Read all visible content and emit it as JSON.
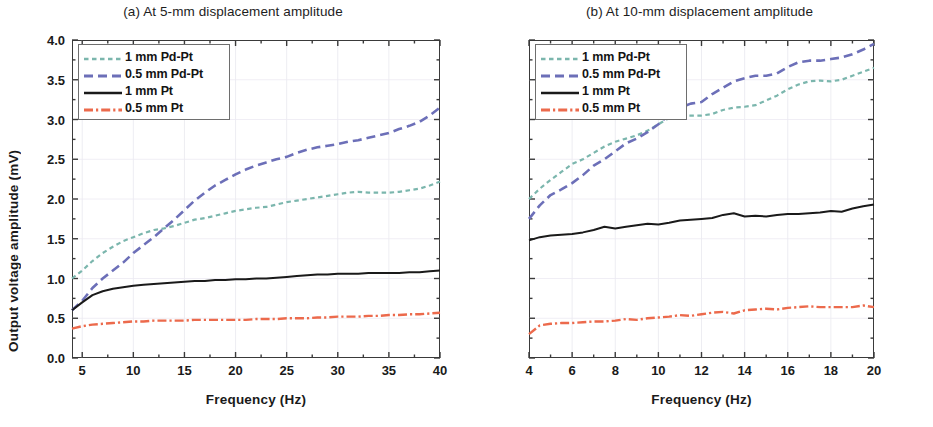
{
  "figure": {
    "axis_label_x": "Frequency (Hz)",
    "axis_label_y": "Output voltage amplitude (mV)"
  },
  "series_colors": {
    "pdpt_1mm": "#7bb6ad",
    "pdpt_05mm": "#6c6fb8",
    "pt_1mm": "#1a1a1a",
    "pt_05mm": "#ec6a4c"
  },
  "legend": {
    "entries": [
      {
        "label": "1 mm Pd-Pt",
        "color": "#7bb6ad",
        "style": "dotted-dash"
      },
      {
        "label": "0.5 mm Pd-Pt",
        "color": "#6c6fb8",
        "style": "dashed"
      },
      {
        "label": "1 mm Pt",
        "color": "#1a1a1a",
        "style": "solid"
      },
      {
        "label": "0.5 mm Pt",
        "color": "#ec6a4c",
        "style": "dash-dot"
      }
    ]
  },
  "chart_data": [
    {
      "type": "line",
      "panel": "a",
      "title": "(a) At 5-mm displacement amplitude",
      "xlabel": "Frequency (Hz)",
      "ylabel": "Output voltage amplitude (mV)",
      "xlim": [
        4,
        40
      ],
      "ylim": [
        0.0,
        4.0
      ],
      "xticks": [
        5,
        10,
        15,
        20,
        25,
        30,
        35,
        40
      ],
      "yticks": [
        0.0,
        0.5,
        1.0,
        1.5,
        2.0,
        2.5,
        3.0,
        3.5,
        4.0
      ],
      "xtick_labels": [
        "5",
        "10",
        "15",
        "20",
        "25",
        "30",
        "35",
        "40"
      ],
      "ytick_labels": [
        "0.0",
        "0.5",
        "1.0",
        "1.5",
        "2.0",
        "2.5",
        "3.0",
        "3.5",
        "4.0"
      ],
      "minor_ticks": true,
      "grid": "faint",
      "legend_position": "top-left",
      "x": [
        4,
        5,
        6,
        7,
        8,
        9,
        10,
        11,
        12,
        13,
        14,
        15,
        16,
        17,
        18,
        19,
        20,
        21,
        22,
        23,
        24,
        25,
        26,
        27,
        28,
        29,
        30,
        31,
        32,
        33,
        34,
        35,
        36,
        37,
        38,
        39,
        40
      ],
      "series": [
        {
          "name": "1 mm Pd-Pt",
          "color": "#7bb6ad",
          "values": [
            1.0,
            1.1,
            1.22,
            1.32,
            1.4,
            1.47,
            1.52,
            1.57,
            1.61,
            1.63,
            1.66,
            1.7,
            1.74,
            1.76,
            1.79,
            1.82,
            1.85,
            1.87,
            1.89,
            1.9,
            1.93,
            1.96,
            1.98,
            2.0,
            2.02,
            2.04,
            2.06,
            2.08,
            2.09,
            2.08,
            2.08,
            2.08,
            2.09,
            2.11,
            2.13,
            2.17,
            2.22
          ]
        },
        {
          "name": "0.5 mm Pd-Pt",
          "color": "#6c6fb8",
          "values": [
            0.6,
            0.72,
            0.88,
            1.0,
            1.1,
            1.2,
            1.32,
            1.42,
            1.52,
            1.63,
            1.74,
            1.86,
            1.98,
            2.08,
            2.17,
            2.24,
            2.31,
            2.37,
            2.42,
            2.46,
            2.5,
            2.53,
            2.58,
            2.62,
            2.65,
            2.67,
            2.69,
            2.72,
            2.74,
            2.77,
            2.8,
            2.83,
            2.88,
            2.92,
            2.97,
            3.05,
            3.15
          ]
        },
        {
          "name": "1 mm Pt",
          "color": "#1a1a1a",
          "values": [
            0.6,
            0.7,
            0.79,
            0.84,
            0.87,
            0.89,
            0.91,
            0.92,
            0.93,
            0.94,
            0.95,
            0.96,
            0.97,
            0.97,
            0.98,
            0.98,
            0.99,
            0.99,
            1.0,
            1.0,
            1.01,
            1.02,
            1.03,
            1.04,
            1.05,
            1.05,
            1.06,
            1.06,
            1.06,
            1.07,
            1.07,
            1.07,
            1.07,
            1.08,
            1.08,
            1.09,
            1.1
          ]
        },
        {
          "name": "0.5 mm Pt",
          "color": "#ec6a4c",
          "values": [
            0.37,
            0.4,
            0.42,
            0.43,
            0.44,
            0.45,
            0.46,
            0.46,
            0.47,
            0.47,
            0.47,
            0.47,
            0.48,
            0.48,
            0.48,
            0.48,
            0.48,
            0.48,
            0.49,
            0.49,
            0.49,
            0.5,
            0.5,
            0.5,
            0.51,
            0.51,
            0.52,
            0.52,
            0.52,
            0.53,
            0.53,
            0.54,
            0.54,
            0.55,
            0.55,
            0.56,
            0.57
          ]
        }
      ]
    },
    {
      "type": "line",
      "panel": "b",
      "title": "(b) At 10-mm displacement amplitude",
      "xlabel": "Frequency (Hz)",
      "ylabel": "Output voltage amplitude (mV)",
      "xlim": [
        4,
        20
      ],
      "ylim": [
        0.0,
        4.0
      ],
      "xticks": [
        4,
        6,
        8,
        10,
        12,
        14,
        16,
        18,
        20
      ],
      "yticks": [
        0.0,
        0.5,
        1.0,
        1.5,
        2.0,
        2.5,
        3.0,
        3.5,
        4.0
      ],
      "xtick_labels": [
        "4",
        "6",
        "8",
        "10",
        "12",
        "14",
        "16",
        "18",
        "20"
      ],
      "ytick_labels": [
        "0.0",
        "0.5",
        "1.0",
        "1.5",
        "2.0",
        "2.5",
        "3.0",
        "3.5",
        "4.0"
      ],
      "minor_ticks": true,
      "grid": "faint",
      "legend_position": "top-left",
      "x": [
        4.0,
        4.5,
        5.0,
        5.5,
        6.0,
        6.5,
        7.0,
        7.5,
        8.0,
        8.5,
        9.0,
        9.5,
        10.0,
        10.5,
        11.0,
        11.5,
        12.0,
        12.5,
        13.0,
        13.5,
        14.0,
        14.5,
        15.0,
        15.5,
        16.0,
        16.5,
        17.0,
        17.5,
        18.0,
        18.5,
        19.0,
        19.5,
        20.0
      ],
      "series": [
        {
          "name": "1 mm Pd-Pt",
          "color": "#7bb6ad",
          "values": [
            2.0,
            2.13,
            2.24,
            2.34,
            2.44,
            2.5,
            2.58,
            2.66,
            2.72,
            2.76,
            2.8,
            2.86,
            2.94,
            3.02,
            3.05,
            3.05,
            3.05,
            3.07,
            3.12,
            3.15,
            3.16,
            3.18,
            3.24,
            3.3,
            3.38,
            3.44,
            3.48,
            3.49,
            3.48,
            3.5,
            3.55,
            3.6,
            3.65
          ]
        },
        {
          "name": "0.5 mm Pd-Pt",
          "color": "#6c6fb8",
          "values": [
            1.75,
            1.92,
            2.05,
            2.12,
            2.2,
            2.3,
            2.42,
            2.5,
            2.6,
            2.7,
            2.76,
            2.84,
            2.94,
            3.06,
            3.15,
            3.2,
            3.22,
            3.32,
            3.4,
            3.48,
            3.52,
            3.55,
            3.55,
            3.58,
            3.66,
            3.72,
            3.74,
            3.74,
            3.76,
            3.78,
            3.82,
            3.88,
            3.95
          ]
        },
        {
          "name": "1 mm Pt",
          "color": "#1a1a1a",
          "values": [
            1.48,
            1.52,
            1.54,
            1.55,
            1.56,
            1.58,
            1.61,
            1.65,
            1.63,
            1.65,
            1.67,
            1.69,
            1.68,
            1.7,
            1.73,
            1.74,
            1.75,
            1.76,
            1.8,
            1.82,
            1.78,
            1.79,
            1.78,
            1.8,
            1.81,
            1.81,
            1.82,
            1.83,
            1.85,
            1.84,
            1.88,
            1.91,
            1.93
          ]
        },
        {
          "name": "0.5 mm Pt",
          "color": "#ec6a4c",
          "values": [
            0.3,
            0.41,
            0.43,
            0.44,
            0.44,
            0.45,
            0.46,
            0.46,
            0.47,
            0.49,
            0.48,
            0.5,
            0.51,
            0.52,
            0.54,
            0.53,
            0.55,
            0.57,
            0.58,
            0.56,
            0.6,
            0.61,
            0.62,
            0.61,
            0.63,
            0.64,
            0.65,
            0.64,
            0.64,
            0.64,
            0.64,
            0.66,
            0.64
          ]
        }
      ]
    }
  ]
}
